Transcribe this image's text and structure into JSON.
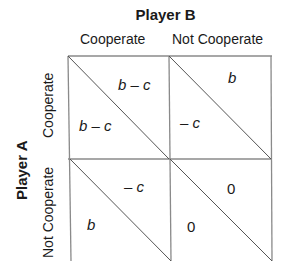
{
  "player_b": {
    "label": "Player B",
    "columns": [
      "Cooperate",
      "Not Cooperate"
    ]
  },
  "player_a": {
    "label": "Player A",
    "rows": [
      "Cooperate",
      "Not Cooperate"
    ]
  },
  "cells": {
    "coop_coop": {
      "a_payoff": "b – c",
      "b_payoff": "b – c"
    },
    "coop_ncoop": {
      "a_payoff": "– c",
      "b_payoff": "b"
    },
    "ncoop_coop": {
      "a_payoff": "b",
      "b_payoff": "– c"
    },
    "ncoop_ncoop": {
      "a_payoff": "0",
      "b_payoff": "0"
    }
  },
  "colors": {
    "line": "#8a8a8a",
    "text": "#1a1a1a",
    "background": "#ffffff"
  }
}
